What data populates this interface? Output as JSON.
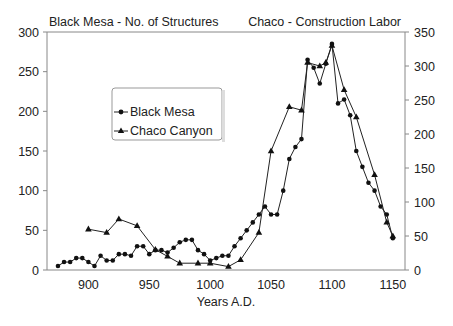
{
  "chart_data": {
    "type": "line",
    "title_left": "Black Mesa - No. of Structures",
    "title_right": "Chaco - Construction Labor",
    "xlabel": "Years A.D.",
    "ylabel_left": "Black Mesa - No. of Structures",
    "ylabel_right": "Chaco - Construction Labor",
    "xlim": [
      866,
      1160
    ],
    "ylim_left": [
      0,
      300
    ],
    "ylim_right": [
      0,
      350
    ],
    "x_ticks": [
      900,
      950,
      1000,
      1050,
      1100,
      1150
    ],
    "y_ticks_left": [
      0,
      50,
      100,
      150,
      200,
      250,
      300
    ],
    "y_ticks_right": [
      0,
      50,
      100,
      150,
      200,
      250,
      300,
      350
    ],
    "grid": false,
    "legend_position": "upper-left-inside",
    "series": [
      {
        "name": "Black Mesa",
        "axis": "left",
        "marker": "circle",
        "x": [
          875,
          880,
          885,
          890,
          895,
          900,
          905,
          910,
          915,
          920,
          925,
          930,
          935,
          940,
          945,
          950,
          955,
          960,
          965,
          970,
          975,
          980,
          985,
          990,
          995,
          1000,
          1005,
          1010,
          1015,
          1020,
          1025,
          1030,
          1035,
          1040,
          1045,
          1050,
          1055,
          1060,
          1065,
          1070,
          1075,
          1080,
          1085,
          1090,
          1095,
          1100,
          1105,
          1110,
          1115,
          1120,
          1125,
          1130,
          1135,
          1140,
          1145,
          1150
        ],
        "values": [
          5,
          10,
          10,
          15,
          15,
          10,
          5,
          18,
          12,
          12,
          20,
          20,
          18,
          30,
          30,
          20,
          25,
          25,
          22,
          28,
          35,
          38,
          38,
          25,
          20,
          12,
          15,
          18,
          18,
          30,
          40,
          50,
          60,
          70,
          80,
          70,
          70,
          100,
          140,
          155,
          165,
          265,
          255,
          235,
          260,
          285,
          210,
          215,
          195,
          150,
          130,
          110,
          100,
          80,
          70,
          40
        ]
      },
      {
        "name": "Chaco Canyon",
        "axis": "right",
        "marker": "triangle",
        "x": [
          900,
          915,
          925,
          940,
          955,
          965,
          975,
          990,
          1000,
          1015,
          1025,
          1040,
          1050,
          1065,
          1075,
          1080,
          1090,
          1095,
          1100,
          1110,
          1120,
          1135,
          1145,
          1150
        ],
        "values": [
          60,
          55,
          75,
          65,
          30,
          20,
          10,
          10,
          10,
          5,
          15,
          55,
          175,
          240,
          235,
          305,
          300,
          305,
          330,
          265,
          225,
          140,
          70,
          50
        ]
      }
    ]
  },
  "legend": {
    "items": [
      {
        "label": "Black Mesa",
        "marker": "circle"
      },
      {
        "label": "Chaco Canyon",
        "marker": "triangle"
      }
    ]
  }
}
